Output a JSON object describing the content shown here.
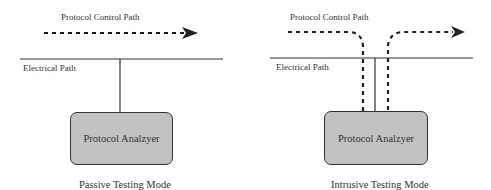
{
  "passive": {
    "control_path_label": "Protocol Control Path",
    "electrical_path_label": "Electrical Path",
    "analyzer_label": "Protocol Analzyer",
    "caption": "Passive Testing Mode"
  },
  "intrusive": {
    "control_path_label": "Protocol Control Path",
    "electrical_path_label": "Electrical Path",
    "analyzer_label": "Protocol Analzyer",
    "caption": "Intrusive Testing Mode"
  },
  "colors": {
    "line": "#333333",
    "box_fill": "#c2c2c2"
  }
}
